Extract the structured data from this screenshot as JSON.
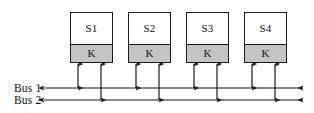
{
  "figure": {
    "background_color": "#ffffff",
    "line_color": "#1a1a1a",
    "module_fill_top": "#ffffff",
    "module_fill_bottom": "#c4c4c4"
  },
  "modules": [
    {
      "id": "module-1",
      "top_label": "S1",
      "bottom_label": "K",
      "x": 70,
      "y": 12,
      "width": 43,
      "height": 51
    },
    {
      "id": "module-2",
      "top_label": "S2",
      "bottom_label": "K",
      "x": 128,
      "y": 12,
      "width": 43,
      "height": 51
    },
    {
      "id": "module-3",
      "top_label": "S3",
      "bottom_label": "K",
      "x": 186,
      "y": 12,
      "width": 43,
      "height": 51
    },
    {
      "id": "module-4",
      "top_label": "S4",
      "bottom_label": "K",
      "x": 244,
      "y": 12,
      "width": 43,
      "height": 51
    }
  ],
  "buses": [
    {
      "id": "bus-1",
      "label": "Bus 1",
      "y": 88,
      "x_start": 44,
      "x_end": 303,
      "arrowheads": "both",
      "label_x": 14,
      "label_y": 83
    },
    {
      "id": "bus-2",
      "label": "Bus 2",
      "y": 100,
      "x_start": 44,
      "x_end": 303,
      "arrowheads": "both",
      "label_x": 14,
      "label_y": 95
    }
  ],
  "connectors": [
    {
      "id": "connector-m1-bus1",
      "module": "S1",
      "bus": "Bus 1",
      "x": 78,
      "y_top": 64,
      "y_bottom": 88,
      "arrowheads": "both"
    },
    {
      "id": "connector-m1-bus2",
      "module": "S1",
      "bus": "Bus 2",
      "x": 101,
      "y_top": 64,
      "y_bottom": 100,
      "arrowheads": "both"
    },
    {
      "id": "connector-m2-bus1",
      "module": "S2",
      "bus": "Bus 1",
      "x": 136,
      "y_top": 64,
      "y_bottom": 88,
      "arrowheads": "both"
    },
    {
      "id": "connector-m2-bus2",
      "module": "S2",
      "bus": "Bus 2",
      "x": 159,
      "y_top": 64,
      "y_bottom": 100,
      "arrowheads": "both"
    },
    {
      "id": "connector-m3-bus1",
      "module": "S3",
      "bus": "Bus 1",
      "x": 194,
      "y_top": 64,
      "y_bottom": 88,
      "arrowheads": "both"
    },
    {
      "id": "connector-m3-bus2",
      "module": "S3",
      "bus": "Bus 2",
      "x": 217,
      "y_top": 64,
      "y_bottom": 100,
      "arrowheads": "both"
    },
    {
      "id": "connector-m4-bus1",
      "module": "S4",
      "bus": "Bus 1",
      "x": 252,
      "y_top": 64,
      "y_bottom": 88,
      "arrowheads": "both"
    },
    {
      "id": "connector-m4-bus2",
      "module": "S4",
      "bus": "Bus 2",
      "x": 275,
      "y_top": 64,
      "y_bottom": 100,
      "arrowheads": "both"
    }
  ]
}
